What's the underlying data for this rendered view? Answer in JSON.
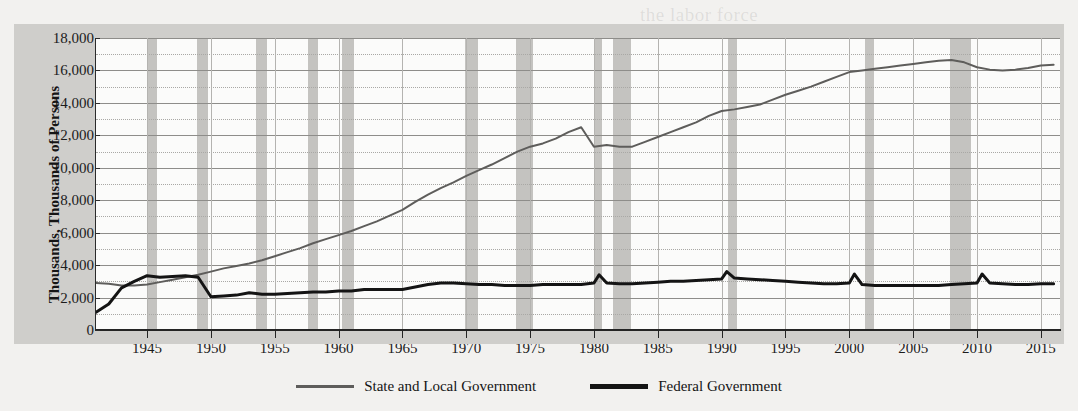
{
  "chart_data": {
    "type": "line",
    "title": "",
    "xlabel": "",
    "ylabel": "Thousands, Thousands of Persons",
    "xlim": [
      1941,
      2016.5
    ],
    "ylim": [
      0,
      18000
    ],
    "grid": true,
    "legend_position": "bottom-center",
    "y_ticks": [
      "0",
      "2,000",
      "4,000",
      "6,000",
      "8,000",
      "10,000",
      "12,000",
      "14,000",
      "16,000",
      "18,000"
    ],
    "y_tick_values": [
      0,
      2000,
      4000,
      6000,
      8000,
      10000,
      12000,
      14000,
      16000,
      18000
    ],
    "y_minor_values": [
      1000,
      3000,
      5000,
      7000,
      9000,
      11000,
      13000,
      15000,
      17000
    ],
    "x_ticks": [
      "1945",
      "1950",
      "1955",
      "1960",
      "1965",
      "1970",
      "1975",
      "1980",
      "1985",
      "1990",
      "1995",
      "2000",
      "2005",
      "2010",
      "2015"
    ],
    "x_tick_values": [
      1945,
      1950,
      1955,
      1960,
      1965,
      1970,
      1975,
      1980,
      1985,
      1990,
      1995,
      2000,
      2005,
      2010,
      2015
    ],
    "colors": {
      "state_and_local": "#5e5d5b",
      "federal": "#141414",
      "recession_band": "#bfbebb",
      "plot_background": "#fbfbfa",
      "frame_background": "#cfcecb",
      "gridline_major": "#8e8d8a",
      "gridline_minor": "#a9a8a5"
    },
    "recessions": [
      {
        "start": 1945.0,
        "end": 1945.8
      },
      {
        "start": 1948.9,
        "end": 1949.8
      },
      {
        "start": 1953.5,
        "end": 1954.4
      },
      {
        "start": 1957.6,
        "end": 1958.4
      },
      {
        "start": 1960.3,
        "end": 1961.2
      },
      {
        "start": 1969.9,
        "end": 1970.9
      },
      {
        "start": 1973.9,
        "end": 1975.2
      },
      {
        "start": 1980.0,
        "end": 1980.6
      },
      {
        "start": 1981.5,
        "end": 1982.9
      },
      {
        "start": 1990.5,
        "end": 1991.2
      },
      {
        "start": 2001.2,
        "end": 2001.9
      },
      {
        "start": 2007.9,
        "end": 2009.5
      }
    ],
    "series": [
      {
        "name": "State and Local Government",
        "color": "#5e5d5b",
        "width": 2,
        "x": [
          1941,
          1942,
          1943,
          1944,
          1945,
          1946,
          1947,
          1948,
          1949,
          1950,
          1951,
          1952,
          1953,
          1954,
          1955,
          1956,
          1957,
          1958,
          1959,
          1960,
          1961,
          1962,
          1963,
          1964,
          1965,
          1966,
          1967,
          1968,
          1969,
          1970,
          1971,
          1972,
          1973,
          1974,
          1975,
          1976,
          1977,
          1978,
          1979,
          1980,
          1981,
          1982,
          1983,
          1984,
          1985,
          1986,
          1987,
          1988,
          1989,
          1990,
          1991,
          1992,
          1993,
          1994,
          1995,
          1996,
          1997,
          1998,
          1999,
          2000,
          2001,
          2002,
          2003,
          2004,
          2005,
          2006,
          2007,
          2008,
          2009,
          2010,
          2011,
          2012,
          2013,
          2014,
          2015,
          2016
        ],
        "values": [
          2900,
          2850,
          2750,
          2750,
          2800,
          2950,
          3100,
          3250,
          3400,
          3600,
          3800,
          3950,
          4100,
          4300,
          4550,
          4800,
          5050,
          5350,
          5600,
          5850,
          6100,
          6400,
          6700,
          7050,
          7400,
          7900,
          8350,
          8750,
          9100,
          9500,
          9850,
          10200,
          10600,
          11000,
          11300,
          11500,
          11800,
          12200,
          12500,
          11300,
          11400,
          11300,
          11300,
          11600,
          11900,
          12200,
          12500,
          12800,
          13200,
          13500,
          13600,
          13750,
          13900,
          14200,
          14500,
          14750,
          15000,
          15300,
          15600,
          15900,
          16000,
          16100,
          16200,
          16300,
          16400,
          16500,
          16600,
          16650,
          16500,
          16200,
          16050,
          16000,
          16050,
          16150,
          16300,
          16350
        ]
      },
      {
        "name": "Federal Government",
        "color": "#141414",
        "width": 3,
        "x": [
          1941,
          1942,
          1943,
          1944,
          1945,
          1945.5,
          1946,
          1947,
          1948,
          1949,
          1950,
          1951,
          1952,
          1953,
          1954,
          1955,
          1956,
          1957,
          1958,
          1959,
          1960,
          1961,
          1962,
          1963,
          1964,
          1965,
          1966,
          1967,
          1968,
          1969,
          1970,
          1971,
          1972,
          1973,
          1974,
          1975,
          1976,
          1977,
          1978,
          1979,
          1980,
          1980.4,
          1981,
          1982,
          1983,
          1984,
          1985,
          1986,
          1987,
          1988,
          1989,
          1990,
          1990.4,
          1991,
          1992,
          1993,
          1994,
          1995,
          1996,
          1997,
          1998,
          1999,
          2000,
          2000.4,
          2001,
          2002,
          2003,
          2004,
          2005,
          2006,
          2007,
          2008,
          2009,
          2010,
          2010.4,
          2011,
          2012,
          2013,
          2014,
          2015,
          2016
        ],
        "values": [
          1100,
          1600,
          2600,
          3000,
          3350,
          3300,
          3250,
          3300,
          3350,
          3250,
          2050,
          2100,
          2150,
          2300,
          2200,
          2200,
          2250,
          2300,
          2350,
          2350,
          2400,
          2400,
          2500,
          2500,
          2500,
          2500,
          2650,
          2800,
          2900,
          2900,
          2850,
          2800,
          2800,
          2750,
          2750,
          2750,
          2800,
          2800,
          2800,
          2800,
          2900,
          3400,
          2900,
          2850,
          2850,
          2900,
          2950,
          3000,
          3000,
          3050,
          3100,
          3150,
          3600,
          3200,
          3150,
          3100,
          3050,
          3000,
          2950,
          2900,
          2850,
          2850,
          2900,
          3450,
          2800,
          2750,
          2750,
          2750,
          2750,
          2750,
          2750,
          2800,
          2850,
          2900,
          3450,
          2900,
          2850,
          2800,
          2800,
          2850,
          2850
        ]
      }
    ]
  },
  "legend": {
    "items": [
      {
        "label": "State and Local Government",
        "style": "state"
      },
      {
        "label": "Federal Government",
        "style": "federal"
      }
    ]
  },
  "page_bleed": [
    {
      "text": "the labor force",
      "x": 640,
      "y": 4
    },
    {
      "text": "nomic growth",
      "x": 700,
      "y": 146
    },
    {
      "text": "employment grew",
      "x": 690,
      "y": 176
    },
    {
      "text": "ederal government",
      "x": 700,
      "y": 206
    },
    {
      "text": "in the",
      "x": 700,
      "y": 236
    }
  ]
}
